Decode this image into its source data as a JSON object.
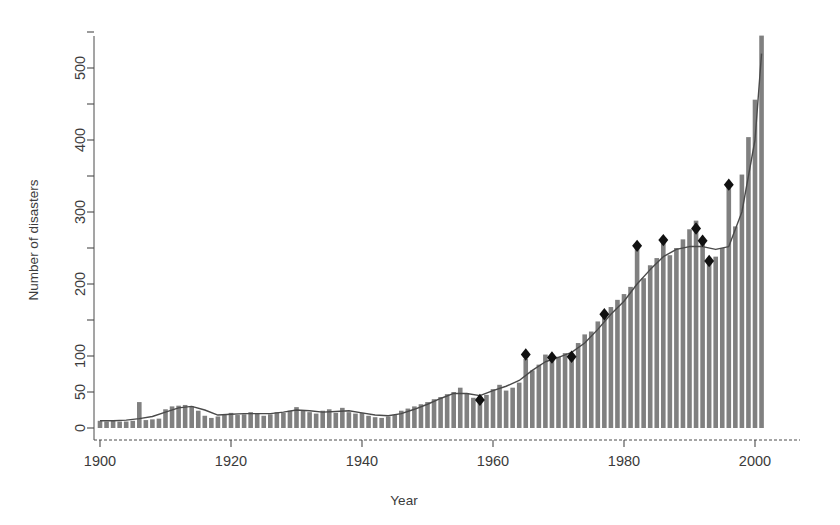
{
  "chart_data": {
    "type": "bar",
    "title": "",
    "xlabel": "Year",
    "ylabel": "Number of disasters",
    "xlim": [
      1899,
      2002
    ],
    "ylim": [
      0,
      555
    ],
    "grid": false,
    "legend": "none",
    "x_ticks": [
      1900,
      1920,
      1940,
      1960,
      1980,
      2000
    ],
    "x_tick_labels": [
      "1900",
      "1920",
      "1940",
      "1960",
      "1980",
      "2000"
    ],
    "x_minor_ticks": [
      1910,
      1930,
      1950,
      1970,
      1990
    ],
    "y_ticks": [
      0,
      50,
      100,
      200,
      300,
      400,
      500
    ],
    "y_tick_labels": [
      "0",
      "50",
      "100",
      "200",
      "300",
      "400",
      "500"
    ],
    "y_minor_ticks": [
      150,
      250,
      350,
      450,
      550
    ],
    "bar_color": "#808080",
    "line_color": "#4a4a4a",
    "marker_color": "#111111",
    "marker_shape": "diamond",
    "series": [
      {
        "name": "Number of disasters",
        "kind": "bar",
        "x": [
          1900,
          1901,
          1902,
          1903,
          1904,
          1905,
          1906,
          1907,
          1908,
          1909,
          1910,
          1911,
          1912,
          1913,
          1914,
          1915,
          1916,
          1917,
          1918,
          1919,
          1920,
          1921,
          1922,
          1923,
          1924,
          1925,
          1926,
          1927,
          1928,
          1929,
          1930,
          1931,
          1932,
          1933,
          1934,
          1935,
          1936,
          1937,
          1938,
          1939,
          1940,
          1941,
          1942,
          1943,
          1944,
          1945,
          1946,
          1947,
          1948,
          1949,
          1950,
          1951,
          1952,
          1953,
          1954,
          1955,
          1956,
          1957,
          1958,
          1959,
          1960,
          1961,
          1962,
          1963,
          1964,
          1965,
          1966,
          1967,
          1968,
          1969,
          1970,
          1971,
          1972,
          1973,
          1974,
          1975,
          1976,
          1977,
          1978,
          1979,
          1980,
          1981,
          1982,
          1983,
          1984,
          1985,
          1986,
          1987,
          1988,
          1989,
          1990,
          1991,
          1992,
          1993,
          1994,
          1995,
          1996,
          1997,
          1998,
          1999,
          2000,
          2001
        ],
        "values": [
          10,
          9,
          10,
          9,
          9,
          10,
          36,
          11,
          12,
          13,
          26,
          30,
          31,
          32,
          30,
          24,
          17,
          14,
          16,
          18,
          21,
          18,
          19,
          22,
          20,
          17,
          19,
          22,
          21,
          24,
          29,
          25,
          22,
          20,
          24,
          26,
          21,
          28,
          22,
          20,
          21,
          17,
          15,
          14,
          16,
          18,
          24,
          27,
          30,
          33,
          36,
          40,
          43,
          47,
          50,
          56,
          48,
          42,
          39,
          46,
          54,
          60,
          52,
          56,
          63,
          96,
          80,
          88,
          102,
          97,
          99,
          104,
          101,
          118,
          130,
          134,
          148,
          158,
          168,
          178,
          186,
          196,
          250,
          208,
          226,
          236,
          258,
          240,
          250,
          262,
          276,
          288,
          258,
          232,
          238,
          250,
          340,
          280,
          352,
          404,
          456,
          545
        ]
      },
      {
        "name": "Smoothed trend",
        "kind": "line",
        "x": [
          1900,
          1902,
          1904,
          1906,
          1908,
          1910,
          1912,
          1914,
          1916,
          1918,
          1920,
          1922,
          1924,
          1926,
          1928,
          1930,
          1932,
          1934,
          1936,
          1938,
          1940,
          1942,
          1944,
          1946,
          1948,
          1950,
          1952,
          1954,
          1956,
          1958,
          1960,
          1962,
          1964,
          1966,
          1968,
          1970,
          1972,
          1974,
          1976,
          1978,
          1980,
          1982,
          1984,
          1986,
          1988,
          1990,
          1992,
          1994,
          1996,
          1998,
          2000,
          2001
        ],
        "values": [
          10,
          10,
          11,
          13,
          16,
          22,
          28,
          30,
          25,
          18,
          19,
          20,
          20,
          20,
          22,
          25,
          24,
          22,
          23,
          24,
          21,
          18,
          17,
          20,
          26,
          33,
          41,
          48,
          48,
          45,
          52,
          58,
          66,
          80,
          92,
          98,
          105,
          118,
          137,
          158,
          176,
          200,
          220,
          238,
          248,
          252,
          252,
          248,
          252,
          300,
          400,
          520
        ]
      }
    ],
    "markers": [
      {
        "x": 1958,
        "y": 39
      },
      {
        "x": 1965,
        "y": 102
      },
      {
        "x": 1969,
        "y": 98
      },
      {
        "x": 1972,
        "y": 99
      },
      {
        "x": 1977,
        "y": 158
      },
      {
        "x": 1982,
        "y": 253
      },
      {
        "x": 1986,
        "y": 261
      },
      {
        "x": 1991,
        "y": 277
      },
      {
        "x": 1992,
        "y": 260
      },
      {
        "x": 1993,
        "y": 232
      },
      {
        "x": 1996,
        "y": 338
      }
    ]
  }
}
